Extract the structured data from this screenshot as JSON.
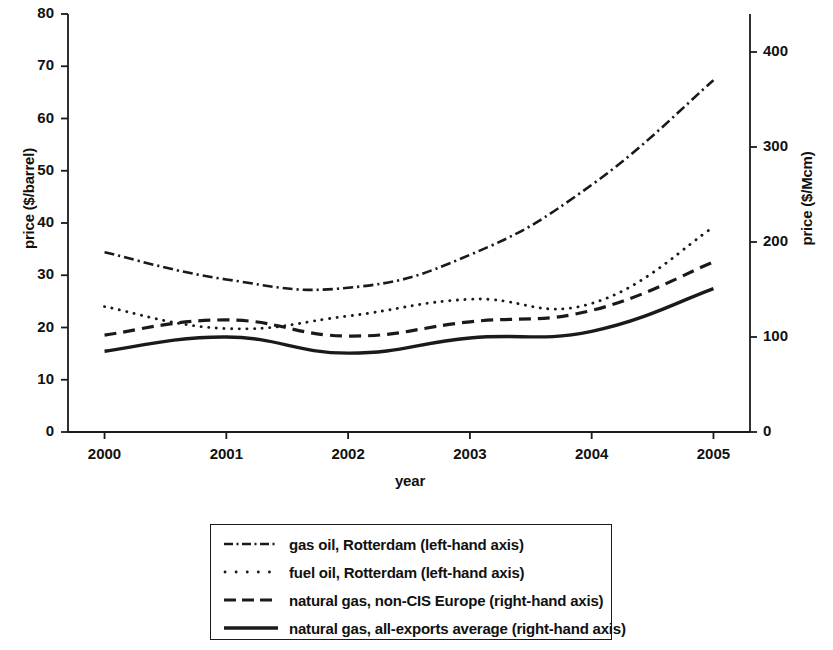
{
  "chart_data": {
    "type": "line",
    "title": "",
    "subtitle": "",
    "xlabel": "year",
    "ylabel": "price ($/barrel)",
    "ylabel_right": "price ($/Mcm)",
    "grid": false,
    "legend_position": "below-plot",
    "x": [
      2000,
      2001,
      2002,
      2003,
      2004,
      2005
    ],
    "categories": [
      "2000",
      "2001",
      "2002",
      "2003",
      "2004",
      "2005"
    ],
    "xlim": [
      1999.7,
      2005.3
    ],
    "ylim": [
      0,
      80
    ],
    "ylim_right": [
      0,
      440
    ],
    "yticks": [
      0,
      10,
      20,
      30,
      40,
      50,
      60,
      70,
      80
    ],
    "ytick_labels": [
      "0",
      "10",
      "20",
      "30",
      "40",
      "50",
      "60",
      "70",
      "80"
    ],
    "yticks_right": [
      0,
      100,
      200,
      300,
      400
    ],
    "ytick_labels_right": [
      "0",
      "100",
      "200",
      "300",
      "400"
    ],
    "xtick_labels": [
      "2000",
      "2001",
      "2002",
      "2003",
      "2004",
      "2005"
    ],
    "series": [
      {
        "name": "gas oil, Rotterdam (left-hand axis)",
        "axis": "left",
        "style": "dash-dot",
        "values": [
          34.4,
          29.2,
          27.6,
          33.9,
          47.3,
          67.3
        ]
      },
      {
        "name": "fuel oil, Rotterdam (left-hand axis)",
        "axis": "left",
        "style": "dotted",
        "values": [
          24.0,
          19.8,
          22.2,
          25.4,
          24.6,
          39.2
        ]
      },
      {
        "name": "natural gas, non-CIS Europe (right-hand axis)",
        "axis": "right",
        "style": "dashed",
        "values": [
          102,
          118,
          101,
          116,
          128,
          179
        ]
      },
      {
        "name": "natural gas, all-exports average (right-hand axis)",
        "axis": "right",
        "style": "solid",
        "values": [
          85,
          100,
          83,
          99,
          106,
          151
        ]
      }
    ]
  },
  "legend": {
    "items": [
      {
        "label": "gas oil, Rotterdam (left-hand axis)",
        "style": "dash-dot"
      },
      {
        "label": "fuel oil, Rotterdam (left-hand axis)",
        "style": "dotted"
      },
      {
        "label": "natural gas, non-CIS Europe (right-hand axis)",
        "style": "dashed"
      },
      {
        "label": "natural gas, all-exports average (right-hand axis)",
        "style": "solid"
      }
    ]
  },
  "colors": {
    "ink": "#1a1a1a",
    "background": "#ffffff"
  }
}
